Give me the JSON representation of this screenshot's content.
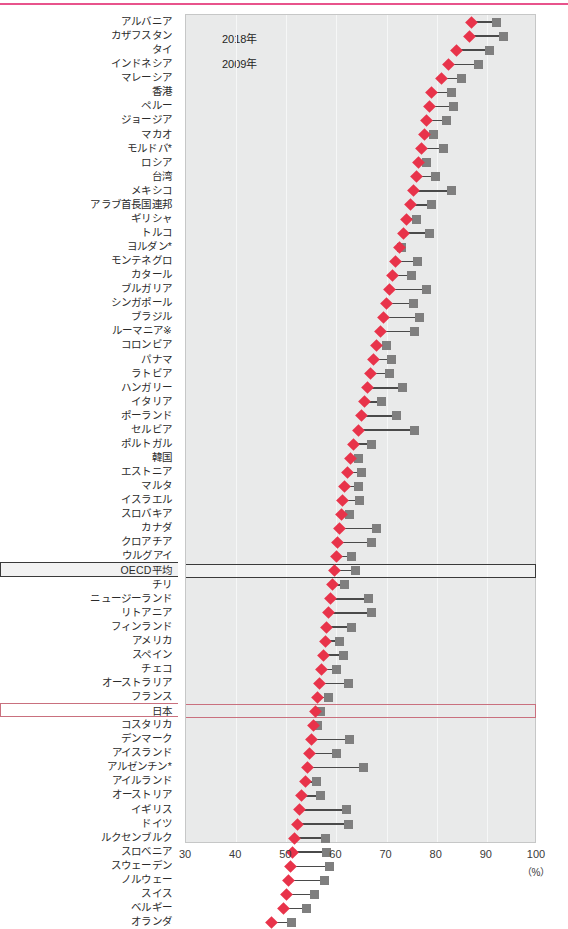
{
  "decor": {
    "top_rule_color": "#e8538c"
  },
  "legend": {
    "position": "top-left-inside-plot",
    "items": [
      {
        "label": "2018年",
        "symbol": "diamond-marker",
        "color": "#e8334a"
      },
      {
        "label": "2009年",
        "symbol": "square-marker",
        "color": "#7f7f7f"
      }
    ]
  },
  "axis": {
    "unit_label": "（%）",
    "ticks": [
      "30",
      "40",
      "50",
      "60",
      "70",
      "80",
      "90",
      "100"
    ]
  },
  "highlight": {
    "oecd_label": "OECD平均",
    "oecd_color": "#3a3a3a",
    "japan_label": "日本",
    "japan_color": "#c9707e"
  },
  "chart_data": {
    "type": "scatter",
    "subtype": "dumbbell",
    "title": "",
    "xlabel": "（%）",
    "ylabel": "",
    "xlim": [
      30,
      100
    ],
    "xticks": [
      30,
      40,
      50,
      60,
      70,
      80,
      90,
      100
    ],
    "grid": true,
    "legend_position": "top-left",
    "series": [
      {
        "name": "2018年",
        "marker": "diamond",
        "color": "#e8334a"
      },
      {
        "name": "2009年",
        "marker": "square",
        "color": "#7f7f7f"
      }
    ],
    "categories": [
      "アルバニア",
      "カザフスタン",
      "タイ",
      "インドネシア",
      "マレーシア",
      "香港",
      "ペルー",
      "ジョージア",
      "マカオ",
      "モルドバ*",
      "ロシア",
      "台湾",
      "メキシコ",
      "アラブ首長国連邦",
      "ギリシャ",
      "トルコ",
      "ヨルダン*",
      "モンテネグロ",
      "カタール",
      "ブルガリア",
      "シンガポール",
      "ブラジル",
      "ルーマニア※",
      "コロンビア",
      "パナマ",
      "ラトビア",
      "ハンガリー",
      "イタリア",
      "ポーランド",
      "セルビア",
      "ポルトガル",
      "韓国",
      "エストニア",
      "マルタ",
      "イスラエル",
      "スロバキア",
      "カナダ",
      "クロアチア",
      "ウルグアイ",
      "OECD平均",
      "チリ",
      "ニュージーランド",
      "リトアニア",
      "フィンランド",
      "アメリカ",
      "スペイン",
      "チェコ",
      "オーストラリア",
      "フランス",
      "日本",
      "コスタリカ",
      "デンマーク",
      "アイスランド",
      "アルゼンチン*",
      "アイルランド",
      "オーストリア",
      "イギリス",
      "ドイツ",
      "ルクセンブルク",
      "スロベニア",
      "スウェーデン",
      "ノルウェー",
      "スイス",
      "ベルギー",
      "オランダ"
    ],
    "values_2018": [
      87.0,
      86.6,
      84.0,
      82.4,
      81.0,
      79.0,
      78.6,
      78.0,
      77.6,
      77.0,
      76.4,
      76.0,
      75.4,
      74.8,
      74.0,
      73.4,
      72.6,
      71.8,
      71.2,
      70.6,
      70.0,
      69.4,
      68.8,
      68.0,
      67.4,
      66.8,
      66.2,
      65.6,
      65.0,
      64.4,
      63.4,
      62.8,
      62.2,
      61.6,
      61.2,
      61.0,
      60.6,
      60.2,
      60.0,
      59.6,
      59.2,
      58.8,
      58.4,
      58.0,
      57.8,
      57.4,
      57.0,
      56.6,
      56.2,
      55.8,
      55.4,
      55.0,
      54.6,
      54.2,
      53.8,
      53.0,
      52.6,
      52.2,
      51.6,
      51.2,
      50.8,
      50.4,
      50.0,
      49.4,
      47.0
    ],
    "values_2009": [
      92.0,
      93.4,
      90.6,
      88.4,
      85.0,
      83.0,
      83.4,
      82.0,
      79.4,
      81.4,
      78.0,
      79.8,
      83.0,
      79.0,
      76.0,
      78.6,
      73.0,
      76.2,
      75.0,
      78.0,
      75.4,
      76.6,
      75.6,
      70.0,
      71.0,
      70.6,
      73.2,
      69.0,
      72.0,
      75.6,
      67.0,
      64.4,
      65.0,
      64.4,
      64.6,
      62.6,
      68.0,
      67.0,
      63.0,
      63.8,
      61.6,
      66.4,
      67.0,
      63.0,
      60.6,
      61.4,
      60.0,
      62.4,
      58.4,
      56.8,
      56.2,
      62.6,
      60.0,
      65.4,
      56.0,
      56.8,
      62.0,
      62.4,
      57.8,
      58.0,
      58.6,
      57.6,
      55.6,
      54.0,
      51.0
    ]
  }
}
